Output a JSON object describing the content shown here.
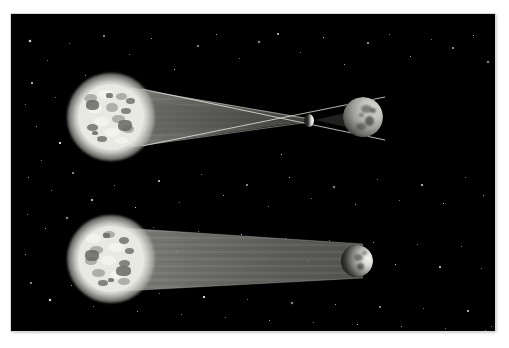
{
  "figure": {
    "caption": "",
    "background_color": "#000000",
    "frame_color": "#ffffff",
    "panel": {
      "x": 11,
      "y": 14,
      "width": 484,
      "height": 317
    }
  },
  "scenes": [
    {
      "id": "top-scene",
      "name": "total-eclipse-geometry",
      "label": "",
      "star": {
        "name": "star",
        "center_x": 100,
        "center_y": 103,
        "radius": 44,
        "disc_radius": 33,
        "color": "#e9e9e4",
        "glow_color": "#f8f8f5"
      },
      "shadow_cone": {
        "name": "converging-shadow-cone",
        "type": "converging",
        "color": "#63635f",
        "apex_x": 297,
        "apex_y": 107,
        "base_top_y": 76,
        "base_bottom_y": 132
      },
      "occulter": {
        "name": "occulting-body",
        "center_x": 298,
        "center_y": 106,
        "radius": 5,
        "color": "#fbfbf8"
      },
      "body": {
        "name": "moon",
        "center_x": 352,
        "center_y": 103,
        "radius": 20,
        "color": "#c3c3c0",
        "phase": "gibbous"
      },
      "rays": [
        {
          "name": "tangent-ray-upper",
          "x1": 133,
          "y1": 76,
          "x2": 372,
          "y2": 124
        },
        {
          "name": "tangent-ray-lower",
          "x1": 133,
          "y1": 131,
          "x2": 372,
          "y2": 84
        }
      ]
    },
    {
      "id": "bottom-scene",
      "name": "partial-eclipse-geometry",
      "label": "",
      "star": {
        "name": "star",
        "center_x": 100,
        "center_y": 245,
        "radius": 44,
        "disc_radius": 33,
        "color": "#e9e9e4",
        "glow_color": "#f8f8f5"
      },
      "shadow_cone": {
        "name": "tapering-shadow-cone",
        "type": "tapering",
        "color": "#6d6d69",
        "base_top_y": 216,
        "base_bottom_y": 274,
        "tip_top_y": 231,
        "tip_bottom_y": 264,
        "tip_x": 356
      },
      "body": {
        "name": "moon",
        "center_x": 346,
        "center_y": 247,
        "radius": 16,
        "color": "#eeeeea",
        "phase": "crescent"
      },
      "rays": []
    }
  ],
  "stars": {
    "name": "starfield",
    "count": 120,
    "color": "#ffffff",
    "points": [
      [
        18,
        26
      ],
      [
        36,
        46
      ],
      [
        58,
        29
      ],
      [
        74,
        61
      ],
      [
        92,
        21
      ],
      [
        118,
        40
      ],
      [
        140,
        24
      ],
      [
        163,
        55
      ],
      [
        186,
        31
      ],
      [
        205,
        20
      ],
      [
        228,
        44
      ],
      [
        247,
        27
      ],
      [
        266,
        19
      ],
      [
        289,
        38
      ],
      [
        312,
        23
      ],
      [
        333,
        50
      ],
      [
        356,
        28
      ],
      [
        378,
        20
      ],
      [
        399,
        42
      ],
      [
        420,
        25
      ],
      [
        441,
        33
      ],
      [
        462,
        21
      ],
      [
        476,
        47
      ],
      [
        487,
        30
      ],
      [
        20,
        68
      ],
      [
        44,
        83
      ],
      [
        66,
        96
      ],
      [
        25,
        112
      ],
      [
        48,
        128
      ],
      [
        30,
        146
      ],
      [
        17,
        163
      ],
      [
        40,
        176
      ],
      [
        61,
        158
      ],
      [
        80,
        185
      ],
      [
        103,
        171
      ],
      [
        124,
        193
      ],
      [
        147,
        166
      ],
      [
        168,
        188
      ],
      [
        190,
        160
      ],
      [
        212,
        181
      ],
      [
        235,
        170
      ],
      [
        257,
        192
      ],
      [
        278,
        163
      ],
      [
        300,
        184
      ],
      [
        322,
        172
      ],
      [
        344,
        190
      ],
      [
        366,
        165
      ],
      [
        388,
        186
      ],
      [
        410,
        170
      ],
      [
        432,
        189
      ],
      [
        454,
        163
      ],
      [
        472,
        181
      ],
      [
        486,
        168
      ],
      [
        16,
        200
      ],
      [
        34,
        214
      ],
      [
        55,
        203
      ],
      [
        77,
        226
      ],
      [
        99,
        208
      ],
      [
        120,
        231
      ],
      [
        142,
        213
      ],
      [
        165,
        236
      ],
      [
        187,
        217
      ],
      [
        208,
        240
      ],
      [
        230,
        220
      ],
      [
        252,
        243
      ],
      [
        274,
        224
      ],
      [
        296,
        246
      ],
      [
        318,
        226
      ],
      [
        340,
        248
      ],
      [
        362,
        228
      ],
      [
        384,
        250
      ],
      [
        406,
        230
      ],
      [
        428,
        252
      ],
      [
        450,
        232
      ],
      [
        470,
        254
      ],
      [
        486,
        236
      ],
      [
        19,
        268
      ],
      [
        38,
        285
      ],
      [
        60,
        271
      ],
      [
        82,
        292
      ],
      [
        104,
        276
      ],
      [
        126,
        297
      ],
      [
        148,
        279
      ],
      [
        170,
        300
      ],
      [
        192,
        282
      ],
      [
        214,
        303
      ],
      [
        236,
        285
      ],
      [
        258,
        306
      ],
      [
        280,
        288
      ],
      [
        302,
        308
      ],
      [
        324,
        290
      ],
      [
        346,
        310
      ],
      [
        368,
        292
      ],
      [
        390,
        312
      ],
      [
        412,
        294
      ],
      [
        434,
        314
      ],
      [
        456,
        296
      ],
      [
        474,
        316
      ],
      [
        488,
        300
      ],
      [
        22,
        318
      ],
      [
        52,
        322
      ],
      [
        88,
        320
      ],
      [
        116,
        325
      ],
      [
        152,
        319
      ],
      [
        186,
        324
      ],
      [
        220,
        317
      ],
      [
        254,
        323
      ],
      [
        288,
        319
      ],
      [
        322,
        325
      ],
      [
        356,
        318
      ],
      [
        390,
        323
      ],
      [
        424,
        320
      ],
      [
        458,
        325
      ],
      [
        480,
        312
      ],
      [
        14,
        240
      ],
      [
        14,
        90
      ],
      [
        492,
        120
      ],
      [
        492,
        260
      ],
      [
        200,
        100
      ],
      [
        270,
        140
      ]
    ]
  },
  "legend": {
    "visible": false,
    "items": []
  },
  "annotations": []
}
